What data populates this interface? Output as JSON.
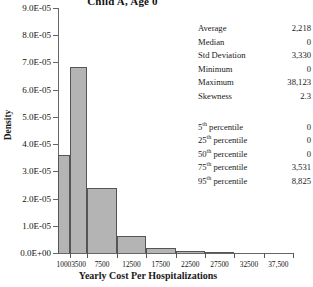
{
  "chart_data": {
    "type": "bar",
    "title": "Child A, Age 0",
    "xlabel": "Yearly Cost Per Hospitalizations",
    "ylabel": "Density",
    "categories": [
      "1000",
      "3500",
      "7500",
      "12500",
      "17500",
      "22500",
      "27500",
      "32500",
      "37,500"
    ],
    "bin_edges": [
      0,
      2000,
      5000,
      10000,
      15000,
      20000,
      25000,
      30000,
      35000,
      40000
    ],
    "values": [
      3.6e-05,
      6.85e-05,
      2.4e-05,
      6.3e-06,
      1.8e-06,
      8e-07,
      1.5e-07,
      0.0,
      0.0
    ],
    "ylim": [
      0.0,
      9e-05
    ],
    "ytick_labels": [
      "0.0E+00",
      "1.0E-05",
      "2.0E-05",
      "3.0E-05",
      "4.0E-05",
      "5.0E-05",
      "6.0E-05",
      "7.0E-05",
      "8.0E-05",
      "9.0E-05"
    ],
    "ytick_values": [
      0.0,
      1e-05,
      2e-05,
      3e-05,
      4e-05,
      5e-05,
      6e-05,
      7e-05,
      8e-05,
      9e-05
    ],
    "grid": false,
    "legend": "none",
    "bar_fill_color": "#b4b4b4",
    "bar_edge_color": "#555555"
  },
  "stats": {
    "rows": [
      {
        "label": "Average",
        "value": "2,218"
      },
      {
        "label": "Median",
        "value": "0"
      },
      {
        "label": "Std Deviation",
        "value": "3,330"
      },
      {
        "label": "Minimum",
        "value": "0"
      },
      {
        "label": "Maximum",
        "value": "38,123"
      },
      {
        "label": "Skewness",
        "value": "2.3"
      }
    ],
    "percentiles": [
      {
        "num": "5",
        "ord": "th",
        "label": " percentile",
        "value": "0"
      },
      {
        "num": "25",
        "ord": "th",
        "label": " percentile",
        "value": "0"
      },
      {
        "num": "50",
        "ord": "th",
        "label": " percentile",
        "value": "0"
      },
      {
        "num": "75",
        "ord": "th",
        "label": " percentile",
        "value": "3,531"
      },
      {
        "num": "95",
        "ord": "th",
        "label": " percentile",
        "value": "8,825"
      }
    ]
  }
}
